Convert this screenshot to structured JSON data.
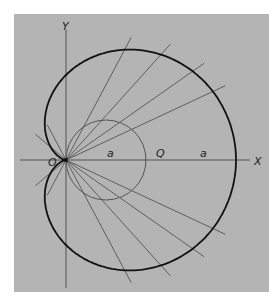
{
  "figure": {
    "type": "cardioid construction",
    "panel_color": "#b4b4b4",
    "curve_color": "#111111",
    "line_color": "#555555",
    "labels": {
      "y_axis": "Y",
      "x_axis": "X",
      "origin": "O",
      "point_q": "Q",
      "segment_a_inner": "a",
      "segment_a_outer": "a"
    },
    "geometry": {
      "origin_px": [
        66,
        160
      ],
      "circle_radius_px": 40,
      "circle_center_px": [
        106,
        160
      ],
      "cardioid_R_px": 42.5,
      "chord_angles_deg": [
        -62,
        -48,
        -35,
        -25,
        25,
        35,
        48,
        62,
        118,
        140,
        220,
        242
      ]
    }
  }
}
